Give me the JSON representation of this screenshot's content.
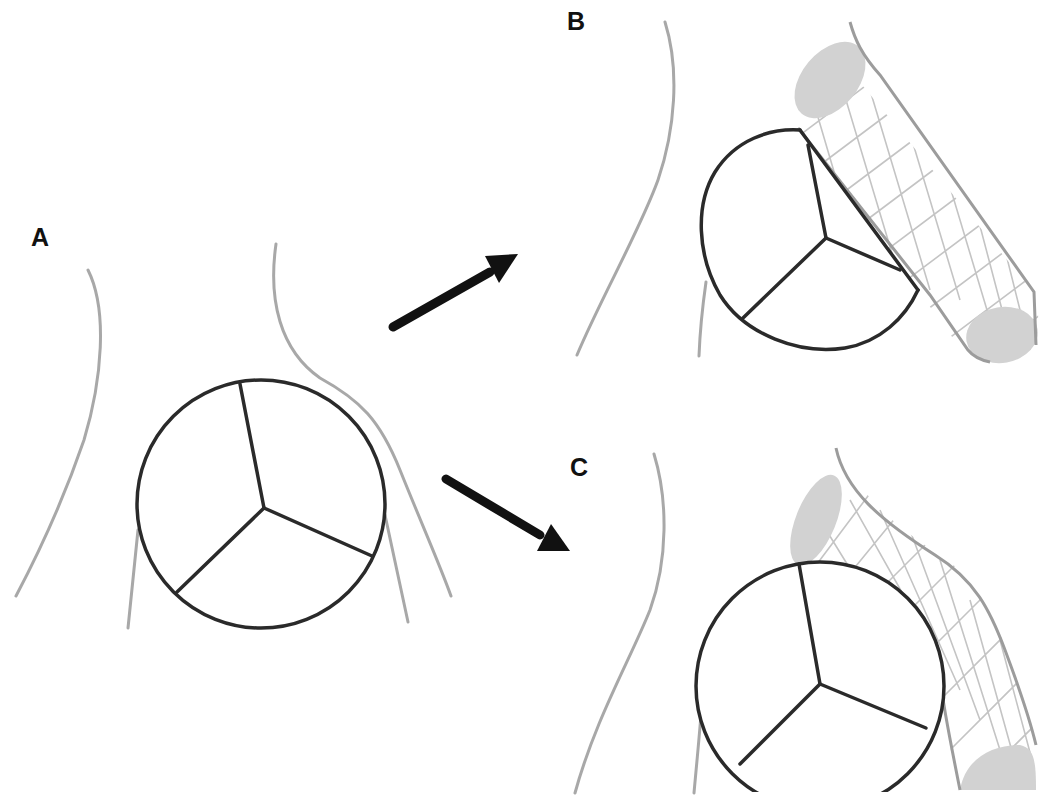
{
  "figure": {
    "panels": [
      {
        "id": "A",
        "label": "A",
        "caption": "Native valve with adjacent coronary artery"
      },
      {
        "id": "B",
        "label": "B",
        "caption": "Coronary stent protruding into aortic root, overlapping valve leaflet"
      },
      {
        "id": "C",
        "label": "C",
        "caption": "Stent flared at ostium, valve circle in front of stent"
      }
    ],
    "arrows": [
      {
        "from": "A",
        "to": "B",
        "direction": "up-right"
      },
      {
        "from": "A",
        "to": "C",
        "direction": "down-right"
      }
    ],
    "colors": {
      "background": "#ffffff",
      "vessel_wall": "#a8a8a8",
      "valve_outline": "#2a2a2a",
      "arrow": "#111111",
      "stent_outline": "#9c9c9c",
      "stent_mesh": "#c4c4c4",
      "stent_end_cap": "#d2d2d2",
      "label": "#111111"
    }
  }
}
